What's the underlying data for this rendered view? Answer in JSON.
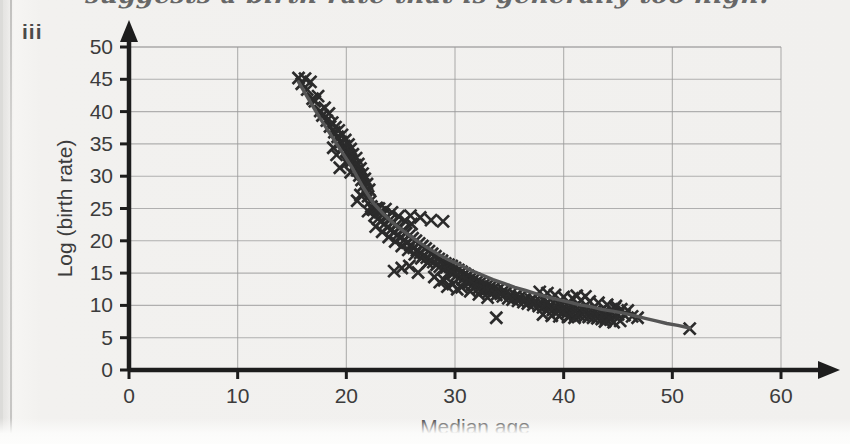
{
  "page": {
    "background_color": "#f2f1ef",
    "handwritten_note": "suggests a birth rate that is generally too high.",
    "part_label": "iii"
  },
  "chart_data": {
    "type": "scatter",
    "title": "",
    "xlabel": "Median age",
    "ylabel": "Log (birth rate)",
    "xlim": [
      0,
      60
    ],
    "ylim": [
      0,
      50
    ],
    "xticks": [
      0,
      10,
      20,
      30,
      40,
      50,
      60
    ],
    "yticks": [
      0,
      5,
      10,
      15,
      20,
      25,
      30,
      35,
      40,
      45,
      50
    ],
    "xtick_labels": [
      "0",
      "10",
      "20",
      "30",
      "40",
      "50",
      "60"
    ],
    "ytick_labels": [
      "0",
      "5",
      "10",
      "15",
      "20",
      "25",
      "30",
      "35",
      "40",
      "45",
      "50"
    ],
    "grid": true,
    "grid_color": "#9a9a9a",
    "axis_color": "#1d1d1d",
    "marker": "x",
    "marker_color": "#2b2b2b",
    "legend": null,
    "trend_line": {
      "present": true,
      "color": "#555555",
      "description": "smooth decaying curve fitted through the points",
      "points": [
        [
          15.6,
          44.6
        ],
        [
          16.5,
          42.0
        ],
        [
          17.5,
          39.2
        ],
        [
          18.5,
          36.6
        ],
        [
          19.5,
          34.0
        ],
        [
          20.5,
          31.4
        ],
        [
          21.5,
          28.4
        ],
        [
          22.5,
          25.8
        ],
        [
          23.5,
          24.0
        ],
        [
          24.5,
          22.5
        ],
        [
          25.5,
          21.2
        ],
        [
          26.5,
          20.0
        ],
        [
          27.5,
          18.9
        ],
        [
          28.5,
          17.9
        ],
        [
          29.5,
          17.0
        ],
        [
          30.5,
          16.2
        ],
        [
          31.5,
          15.4
        ],
        [
          32.5,
          14.7
        ],
        [
          33.5,
          14.0
        ],
        [
          34.5,
          13.4
        ],
        [
          35.5,
          12.8
        ],
        [
          36.5,
          12.3
        ],
        [
          37.5,
          11.8
        ],
        [
          38.5,
          11.3
        ],
        [
          39.5,
          10.9
        ],
        [
          40.5,
          10.5
        ],
        [
          41.5,
          10.1
        ],
        [
          42.5,
          9.8
        ],
        [
          43.5,
          9.4
        ],
        [
          44.5,
          9.1
        ],
        [
          45.5,
          8.8
        ],
        [
          46.5,
          8.4
        ],
        [
          47.5,
          8.0
        ],
        [
          48.5,
          7.6
        ],
        [
          49.5,
          7.2
        ],
        [
          50.5,
          6.9
        ],
        [
          51.6,
          6.5
        ]
      ]
    },
    "points": [
      [
        15.6,
        45.2
      ],
      [
        15.9,
        44.3
      ],
      [
        16.2,
        45.1
      ],
      [
        16.4,
        43.4
      ],
      [
        16.7,
        44.6
      ],
      [
        16.9,
        42.0
      ],
      [
        17.1,
        41.6
      ],
      [
        17.4,
        42.4
      ],
      [
        17.6,
        40.1
      ],
      [
        17.8,
        39.4
      ],
      [
        18.0,
        40.6
      ],
      [
        18.2,
        38.6
      ],
      [
        18.4,
        39.7
      ],
      [
        18.5,
        37.7
      ],
      [
        18.7,
        38.3
      ],
      [
        18.9,
        36.8
      ],
      [
        19.0,
        37.6
      ],
      [
        19.2,
        36.1
      ],
      [
        19.3,
        37.1
      ],
      [
        19.5,
        35.3
      ],
      [
        19.6,
        36.4
      ],
      [
        19.8,
        34.7
      ],
      [
        19.9,
        35.6
      ],
      [
        20.0,
        33.9
      ],
      [
        20.2,
        34.9
      ],
      [
        20.3,
        33.2
      ],
      [
        20.4,
        34.2
      ],
      [
        20.5,
        32.4
      ],
      [
        20.6,
        33.4
      ],
      [
        20.8,
        31.7
      ],
      [
        20.9,
        32.8
      ],
      [
        21.0,
        30.9
      ],
      [
        21.1,
        31.9
      ],
      [
        21.2,
        30.1
      ],
      [
        21.3,
        31.2
      ],
      [
        21.4,
        29.4
      ],
      [
        21.5,
        30.4
      ],
      [
        21.6,
        28.6
      ],
      [
        21.7,
        29.6
      ],
      [
        21.8,
        27.8
      ],
      [
        21.9,
        28.8
      ],
      [
        22.0,
        26.9
      ],
      [
        22.1,
        27.9
      ],
      [
        22.2,
        26.1
      ],
      [
        22.3,
        25.3
      ],
      [
        22.4,
        24.9
      ],
      [
        21.0,
        26.2
      ],
      [
        20.4,
        30.6
      ],
      [
        19.4,
        31.3
      ],
      [
        18.8,
        34.4
      ],
      [
        19.1,
        33.3
      ],
      [
        20.1,
        32.2
      ],
      [
        21.3,
        27.1
      ],
      [
        22.0,
        24.6
      ],
      [
        22.5,
        24.8
      ],
      [
        22.6,
        23.9
      ],
      [
        22.8,
        25.1
      ],
      [
        22.9,
        23.4
      ],
      [
        23.1,
        24.4
      ],
      [
        23.2,
        23.1
      ],
      [
        23.4,
        24.1
      ],
      [
        23.5,
        22.6
      ],
      [
        23.7,
        23.6
      ],
      [
        23.8,
        22.1
      ],
      [
        24.0,
        23.2
      ],
      [
        24.1,
        21.7
      ],
      [
        24.3,
        22.8
      ],
      [
        24.4,
        21.3
      ],
      [
        24.6,
        22.4
      ],
      [
        24.7,
        20.9
      ],
      [
        24.9,
        22.0
      ],
      [
        25.0,
        20.5
      ],
      [
        25.2,
        21.6
      ],
      [
        25.3,
        20.1
      ],
      [
        25.5,
        21.2
      ],
      [
        25.6,
        19.7
      ],
      [
        25.8,
        20.8
      ],
      [
        25.9,
        19.3
      ],
      [
        26.1,
        20.4
      ],
      [
        26.2,
        18.9
      ],
      [
        26.4,
        20.0
      ],
      [
        26.5,
        18.5
      ],
      [
        26.7,
        19.6
      ],
      [
        26.8,
        18.1
      ],
      [
        27.0,
        19.2
      ],
      [
        27.1,
        17.7
      ],
      [
        27.3,
        18.8
      ],
      [
        27.4,
        17.4
      ],
      [
        27.6,
        18.4
      ],
      [
        27.7,
        17.0
      ],
      [
        27.9,
        18.0
      ],
      [
        28.0,
        16.7
      ],
      [
        28.2,
        17.6
      ],
      [
        28.3,
        16.3
      ],
      [
        28.5,
        17.2
      ],
      [
        28.6,
        16.0
      ],
      [
        28.8,
        16.9
      ],
      [
        28.9,
        15.6
      ],
      [
        29.1,
        16.5
      ],
      [
        23.0,
        25.0
      ],
      [
        23.6,
        24.9
      ],
      [
        24.2,
        24.4
      ],
      [
        24.8,
        23.8
      ],
      [
        25.4,
        23.1
      ],
      [
        26.0,
        22.6
      ],
      [
        22.7,
        22.2
      ],
      [
        23.3,
        21.4
      ],
      [
        23.9,
        20.6
      ],
      [
        24.5,
        19.9
      ],
      [
        25.1,
        19.2
      ],
      [
        25.7,
        18.6
      ],
      [
        26.3,
        17.9
      ],
      [
        26.9,
        17.3
      ],
      [
        27.5,
        16.6
      ],
      [
        24.4,
        15.3
      ],
      [
        25.1,
        15.8
      ],
      [
        25.8,
        16.1
      ],
      [
        26.6,
        15.1
      ],
      [
        27.8,
        23.2
      ],
      [
        28.9,
        23.0
      ],
      [
        26.8,
        23.6
      ],
      [
        25.9,
        23.9
      ],
      [
        29.2,
        15.9
      ],
      [
        29.4,
        16.3
      ],
      [
        29.5,
        15.2
      ],
      [
        29.7,
        16.1
      ],
      [
        29.8,
        14.9
      ],
      [
        30.0,
        15.8
      ],
      [
        30.1,
        14.6
      ],
      [
        30.3,
        15.5
      ],
      [
        30.4,
        14.3
      ],
      [
        30.6,
        15.2
      ],
      [
        30.7,
        14.0
      ],
      [
        30.9,
        14.9
      ],
      [
        31.0,
        13.7
      ],
      [
        31.2,
        14.6
      ],
      [
        31.3,
        13.5
      ],
      [
        31.5,
        14.3
      ],
      [
        31.6,
        13.2
      ],
      [
        31.8,
        14.1
      ],
      [
        31.9,
        13.0
      ],
      [
        32.1,
        13.8
      ],
      [
        32.2,
        12.7
      ],
      [
        32.4,
        13.6
      ],
      [
        32.5,
        12.5
      ],
      [
        32.7,
        13.3
      ],
      [
        32.8,
        12.3
      ],
      [
        33.0,
        13.1
      ],
      [
        33.1,
        12.1
      ],
      [
        33.3,
        12.9
      ],
      [
        33.4,
        11.9
      ],
      [
        33.6,
        12.7
      ],
      [
        29.0,
        13.9
      ],
      [
        29.8,
        13.3
      ],
      [
        30.6,
        12.8
      ],
      [
        31.4,
        12.2
      ],
      [
        32.2,
        11.7
      ],
      [
        33.0,
        11.2
      ],
      [
        33.8,
        11.6
      ],
      [
        34.5,
        12.3
      ],
      [
        30.2,
        12.5
      ],
      [
        29.3,
        12.9
      ],
      [
        28.6,
        13.6
      ],
      [
        28.1,
        14.4
      ],
      [
        33.8,
        8.1
      ],
      [
        34.0,
        12.5
      ],
      [
        34.2,
        11.8
      ],
      [
        34.4,
        11.4
      ],
      [
        34.7,
        12.0
      ],
      [
        34.9,
        11.1
      ],
      [
        35.1,
        11.7
      ],
      [
        35.3,
        10.9
      ],
      [
        35.6,
        11.5
      ],
      [
        35.8,
        10.7
      ],
      [
        36.0,
        11.3
      ],
      [
        36.3,
        10.5
      ],
      [
        36.5,
        11.1
      ],
      [
        36.7,
        10.3
      ],
      [
        37.0,
        10.9
      ],
      [
        37.2,
        10.1
      ],
      [
        37.4,
        10.7
      ],
      [
        37.7,
        9.9
      ],
      [
        37.9,
        10.5
      ],
      [
        38.1,
        9.7
      ],
      [
        38.4,
        10.3
      ],
      [
        38.6,
        9.5
      ],
      [
        38.8,
        10.1
      ],
      [
        39.0,
        9.3
      ],
      [
        39.3,
        10.0
      ],
      [
        39.5,
        9.1
      ],
      [
        39.7,
        9.9
      ],
      [
        39.9,
        8.9
      ],
      [
        40.1,
        9.8
      ],
      [
        40.3,
        8.8
      ],
      [
        40.5,
        9.7
      ],
      [
        40.7,
        8.6
      ],
      [
        40.9,
        9.6
      ],
      [
        41.1,
        8.5
      ],
      [
        41.3,
        9.5
      ],
      [
        41.5,
        8.4
      ],
      [
        41.7,
        9.4
      ],
      [
        41.9,
        8.3
      ],
      [
        42.1,
        9.3
      ],
      [
        42.3,
        8.2
      ],
      [
        42.5,
        9.2
      ],
      [
        42.7,
        8.1
      ],
      [
        42.9,
        9.1
      ],
      [
        43.1,
        8.0
      ],
      [
        43.3,
        9.0
      ],
      [
        43.5,
        7.9
      ],
      [
        43.7,
        8.9
      ],
      [
        43.9,
        7.9
      ],
      [
        44.1,
        8.8
      ],
      [
        44.3,
        7.8
      ],
      [
        44.5,
        8.7
      ],
      [
        40.0,
        11.3
      ],
      [
        40.8,
        11.1
      ],
      [
        41.6,
        10.8
      ],
      [
        42.4,
        10.6
      ],
      [
        43.2,
        10.4
      ],
      [
        44.0,
        10.1
      ],
      [
        44.8,
        9.9
      ],
      [
        41.2,
        11.5
      ],
      [
        42.0,
        11.4
      ],
      [
        39.2,
        11.6
      ],
      [
        38.5,
        11.9
      ],
      [
        37.8,
        12.1
      ],
      [
        38.1,
        8.6
      ],
      [
        38.9,
        8.4
      ],
      [
        39.6,
        8.3
      ],
      [
        40.4,
        8.2
      ],
      [
        41.0,
        8.1
      ],
      [
        44.7,
        9.6
      ],
      [
        45.0,
        8.6
      ],
      [
        45.3,
        9.4
      ],
      [
        45.6,
        8.5
      ],
      [
        45.9,
        9.2
      ],
      [
        46.3,
        8.3
      ],
      [
        46.8,
        8.1
      ],
      [
        43.8,
        7.5
      ],
      [
        44.6,
        7.4
      ],
      [
        45.2,
        7.6
      ],
      [
        51.6,
        6.4
      ]
    ]
  }
}
